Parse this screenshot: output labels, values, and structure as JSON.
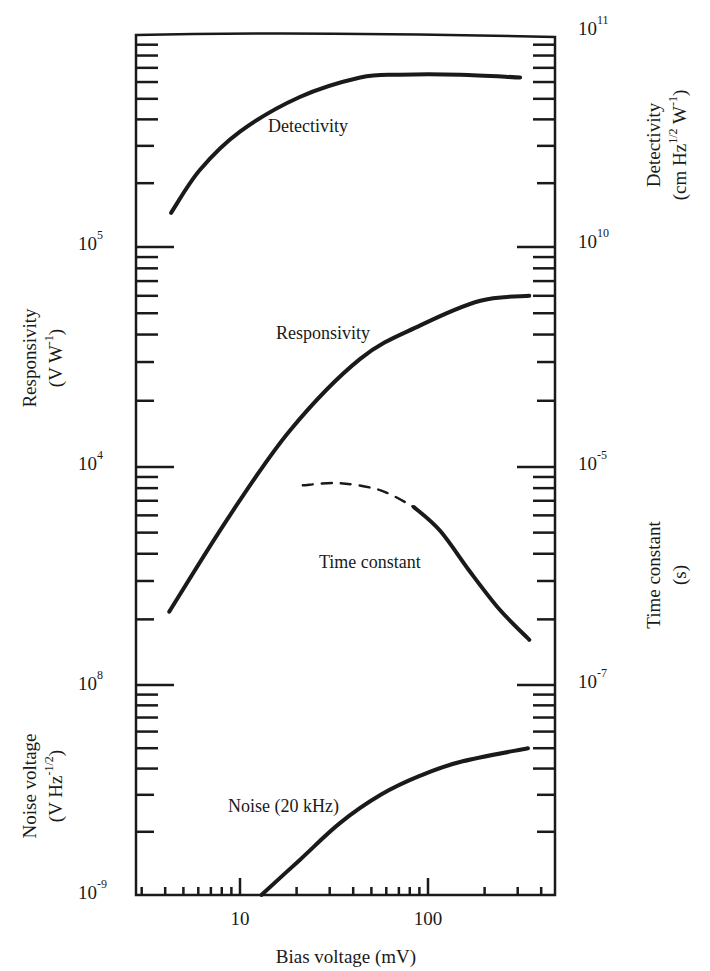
{
  "chart_data": {
    "type": "line",
    "title": "",
    "xlabel": "Bias voltage (mV)",
    "xscale": "log",
    "xlim": [
      2.8,
      470
    ],
    "x_ticks": [
      {
        "value": 10,
        "label": "10"
      },
      {
        "value": 100,
        "label": "100"
      }
    ],
    "grid": false,
    "legend": "none (curves labeled inline)",
    "panels": [
      {
        "id": "detectivity",
        "axis_side": "right",
        "ylabel": "Detectivity",
        "yunit": "(cm Hz^1/2 W^-1)",
        "yscale": "log",
        "ylim": [
          10000000000.0,
          100000000000.0
        ],
        "y_tick_labels": [
          {
            "base": "10",
            "exp": "11",
            "value": 100000000000.0
          },
          {
            "base": "10",
            "exp": "10",
            "value": 10000000000.0
          }
        ],
        "series": [
          {
            "name": "Detectivity",
            "style": "solid",
            "x": [
              4.3,
              6.1,
              10,
              20.8,
              43.6,
              71,
              148,
              309
            ],
            "y": [
              14500000000.0,
              23000000000.0,
              35000000000.0,
              51000000000.0,
              63000000000.0,
              65000000000.0,
              65000000000.0,
              63000000000.0
            ]
          }
        ]
      },
      {
        "id": "responsivity",
        "axis_side": "left",
        "ylabel": "Responsivity",
        "yunit": "(V W^-1)",
        "yscale": "log",
        "ylim": [
          1000.0,
          100000.0
        ],
        "y_tick_labels": [
          {
            "base": "10",
            "exp": "5",
            "value": 100000.0
          },
          {
            "base": "10",
            "exp": "4",
            "value": 10000.0
          }
        ],
        "series": [
          {
            "name": "Responsivity",
            "style": "solid",
            "x": [
              4.2,
              8.8,
              18.5,
              43.6,
              91,
              190,
              346
            ],
            "y": [
              2200,
              6000,
              14700,
              31000,
              44000,
              57000,
              60000
            ]
          }
        ]
      },
      {
        "id": "time_constant",
        "axis_side": "right",
        "ylabel": "Time constant",
        "yunit": "(s)",
        "yscale": "log",
        "ylim": [
          1e-07,
          1e-05
        ],
        "y_tick_labels": [
          {
            "base": "10",
            "exp": "-5",
            "value": 1e-05
          },
          {
            "base": "10",
            "exp": "-7",
            "value": 1e-07
          }
        ],
        "series": [
          {
            "name": "Time constant (estimated)",
            "style": "dashed",
            "x": [
              21.6,
              34,
              56,
              84
            ],
            "y": [
              6.8e-06,
              7.1e-06,
              6.1e-06,
              4.3e-06
            ]
          },
          {
            "name": "Time constant",
            "style": "solid",
            "x": [
              84,
              116,
              167,
              241,
              346
            ],
            "y": [
              4.3e-06,
              2.6e-06,
              1.1e-06,
              4.9e-07,
              2.6e-07
            ]
          }
        ]
      },
      {
        "id": "noise",
        "axis_side": "left",
        "ylabel": "Noise voltage",
        "yunit": "(V Hz^-1/2)",
        "yscale": "log",
        "ylim": [
          1e-09,
          1e-08
        ],
        "y_tick_labels": [
          {
            "base": "10",
            "exp": "8",
            "value": 1e-08
          },
          {
            "base": "10",
            "exp": "-9",
            "value": 1e-09
          }
        ],
        "series": [
          {
            "name": "Noise (20 kHz)",
            "style": "solid",
            "x": [
              13,
              20.8,
              34,
              56,
              91,
              148,
              340
            ],
            "y": [
              1e-09,
              1.47e-09,
              2.2e-09,
              3e-09,
              3.7e-09,
              4.3e-09,
              5e-09
            ]
          }
        ]
      }
    ],
    "annotations": [
      {
        "text": "Detectivity",
        "near": "detectivity curve"
      },
      {
        "text": "Responsivity",
        "near": "responsivity curve"
      },
      {
        "text": "Time constant",
        "near": "time constant curve"
      },
      {
        "text": "Noise (20 kHz)",
        "near": "noise curve"
      }
    ]
  },
  "labels": {
    "x_axis_title": "Bias voltage (mV)",
    "x_tick_10": "10",
    "x_tick_100": "100",
    "detectivity_title": "Detectivity",
    "detectivity_unit_prefix": "(cm Hz",
    "detectivity_unit_exp1": "1/2",
    "detectivity_unit_mid": " W",
    "detectivity_unit_exp2": "-1",
    "detectivity_unit_suffix": ")",
    "responsivity_title": "Responsivity",
    "responsivity_unit_prefix": "(V W",
    "responsivity_unit_exp": "-1",
    "responsivity_unit_suffix": ")",
    "time_constant_title": "Time constant",
    "time_constant_unit": "(s)",
    "noise_title": "Noise voltage",
    "noise_unit_prefix": "(V Hz",
    "noise_unit_exp": "-1/2",
    "noise_unit_suffix": ")",
    "curve_detectivity": "Detectivity",
    "curve_responsivity": "Responsivity",
    "curve_time_constant": "Time constant",
    "curve_noise": "Noise (20 kHz)"
  }
}
